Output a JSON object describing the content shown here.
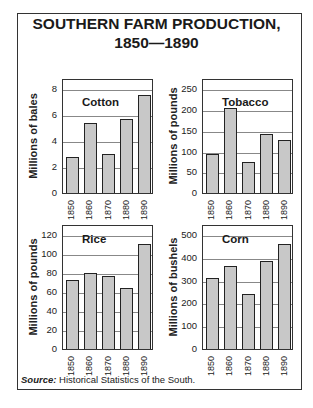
{
  "title_line1": "SOUTHERN FARM PRODUCTION,",
  "title_line2": "1850—1890",
  "source_label": "Source:",
  "source_text": " Historical Statistics of the South.",
  "bar_color": "#c8c8c8",
  "chart_data": [
    {
      "type": "bar",
      "title": "Cotton",
      "ylabel": "Millions of bales",
      "xlabel": "",
      "categories": [
        "1850",
        "1860",
        "1870",
        "1880",
        "1890"
      ],
      "values": [
        2.8,
        5.4,
        3.0,
        5.7,
        7.6
      ],
      "yticks": [
        "0",
        "2",
        "4",
        "6",
        "8"
      ],
      "ylim": [
        0,
        8.8
      ],
      "grid": true
    },
    {
      "type": "bar",
      "title": "Tobacco",
      "ylabel": "Millions of pounds",
      "xlabel": "",
      "categories": [
        "1850",
        "1860",
        "1870",
        "1880",
        "1890"
      ],
      "values": [
        95,
        204,
        76,
        143,
        128
      ],
      "yticks": [
        "0",
        "50",
        "100",
        "150",
        "200",
        "250"
      ],
      "ylim": [
        0,
        275
      ],
      "grid": true
    },
    {
      "type": "bar",
      "title": "Rice",
      "ylabel": "Millions of pounds",
      "xlabel": "",
      "categories": [
        "1850",
        "1860",
        "1870",
        "1880",
        "1890"
      ],
      "values": [
        72,
        80,
        77,
        64,
        110
      ],
      "yticks": [
        "0",
        "20",
        "40",
        "60",
        "80",
        "100",
        "120"
      ],
      "ylim": [
        0,
        130
      ],
      "grid": true
    },
    {
      "type": "bar",
      "title": "Corn",
      "ylabel": "Millions of bushels",
      "xlabel": "",
      "categories": [
        "1850",
        "1860",
        "1870",
        "1880",
        "1890"
      ],
      "values": [
        314,
        363,
        244,
        389,
        460
      ],
      "yticks": [
        "0",
        "100",
        "200",
        "300",
        "400",
        "500"
      ],
      "ylim": [
        0,
        545
      ],
      "grid": true
    }
  ]
}
